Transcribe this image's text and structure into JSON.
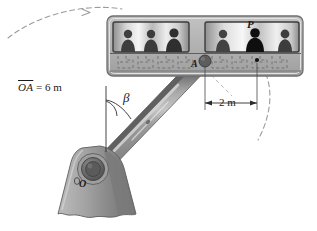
{
  "figure": {
    "labels": {
      "arm_length_prefix": "OA",
      "arm_length_value": " = 6 m",
      "angle_symbol": "β",
      "dimension_text": "2 m",
      "point_a": "A",
      "point_o": "O",
      "point_p": "P"
    },
    "colors": {
      "arm_body": "#8f8f8f",
      "arm_top_edge": "#5a5a5a",
      "arm_highlight": "#c9c9c9",
      "base": "#9a9a9a",
      "base_shadow": "#767676",
      "hub_outer": "#7d7d7d",
      "hub_inner": "#595959",
      "gondola_body": "#b4b4b4",
      "gondola_frame": "#8c8c8c",
      "window_light": "#f2f2f2",
      "window_mid": "#9d9d9d",
      "passenger": "#3a3a3a",
      "passenger_highlight": "#111111",
      "dashed_path": "#9c9c9c",
      "seat_outline": "#6e6e6e",
      "ink": "#1a1a1a"
    },
    "geometry": {
      "pivot_o": [
        90,
        172
      ],
      "point_a": [
        205,
        64
      ],
      "point_p": [
        258,
        63
      ],
      "dimension_span_m": 2,
      "arm_length_m": 6
    },
    "annotations": {
      "motion_arc_left": "dashed trajectory arc with arrowhead, upper left",
      "motion_arc_right": "dashed trajectory arc, lower right",
      "angle_reference": "vertical reference line from arm",
      "dimension_line": "double-headed horizontal dimension between A and P"
    }
  }
}
